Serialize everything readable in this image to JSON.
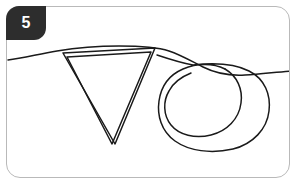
{
  "card": {
    "border_color": "#b9b9b9",
    "background_color": "#ffffff",
    "corner_radius_px": 14
  },
  "badge": {
    "number": "5",
    "fill_color": "#2d2d2d",
    "text_color": "#ffffff",
    "shape": "rounded-tab"
  },
  "drawing": {
    "stroke_color": "#1a1a1a",
    "description": "hand-drawn line sketch: a long horizontal wavy baseline crossing the frame, a downward-pointing outlined triangle on the left, and a pair of overlapping looping circles on the right",
    "elements": [
      {
        "name": "baseline-curve",
        "label": "horizontal wavy line"
      },
      {
        "name": "triangle-outline",
        "label": "downward triangle, double-stroke outline"
      },
      {
        "name": "loop-spiral",
        "label": "overlapping circular loops"
      }
    ]
  }
}
